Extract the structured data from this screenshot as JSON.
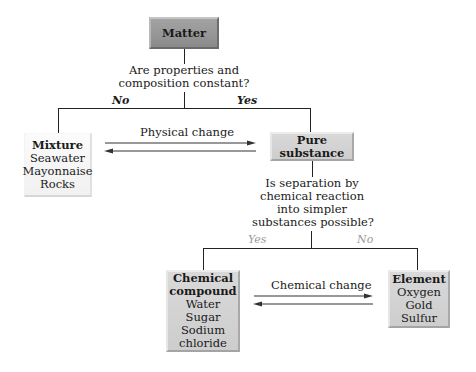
{
  "diagram": {
    "nodes": {
      "matter": {
        "title": "Matter",
        "items": []
      },
      "mixture": {
        "title": "Mixture",
        "items": [
          "Seawater",
          "Mayonnaise",
          "Rocks"
        ]
      },
      "pure_substance": {
        "title": "Pure substance",
        "items": []
      },
      "compound": {
        "title_line1": "Chemical",
        "title_line2": "compound",
        "items": [
          "Water",
          "Sugar",
          "Sodium",
          "chloride"
        ]
      },
      "element": {
        "title": "Element",
        "items": [
          "Oxygen",
          "Gold",
          "Sulfur"
        ]
      }
    },
    "questions": {
      "q1_line1": "Are properties and",
      "q1_line2": "composition constant?",
      "q2_line1": "Is separation by",
      "q2_line2": "chemical reaction",
      "q2_line3": "into simpler",
      "q2_line4": "substances possible?"
    },
    "branches": {
      "q1_no": "No",
      "q1_yes": "Yes",
      "q2_yes": "Yes",
      "q2_no": "No"
    },
    "transitions": {
      "physical": "Physical change",
      "chemical": "Chemical change"
    },
    "colors": {
      "matter_box": "#959595",
      "mid_box": "#d0d0d0",
      "light_box": "#f5f5f5",
      "line": "#222222",
      "secondary_branch_text": "#9a9a9a"
    }
  }
}
